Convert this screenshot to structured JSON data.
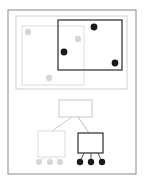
{
  "diagram": {
    "type": "r-tree-spatial-index",
    "colors": {
      "frame": "#8a8a8a",
      "panel": "#cfcfcf",
      "light_group": "#dcdcdc",
      "light_dot": "#d6d6d6",
      "dark_group": "#3a3a3a",
      "dark_dot": "#1a1a1a",
      "edge_light": "#cccccc",
      "edge_dark": "#555555"
    },
    "spatial_view": {
      "light_rect": {
        "x": 22,
        "y": 26,
        "w": 62,
        "h": 59
      },
      "dark_rect": {
        "x": 58,
        "y": 20,
        "w": 64,
        "h": 50
      },
      "light_points": [
        [
          28,
          32
        ],
        [
          78,
          39
        ],
        [
          49,
          78
        ]
      ],
      "dark_points": [
        [
          94,
          27
        ],
        [
          64,
          52
        ],
        [
          115,
          63
        ]
      ]
    },
    "tree_view": {
      "root": {
        "x": 59,
        "y": 100,
        "w": 33,
        "h": 17
      },
      "left_child": {
        "x": 38,
        "y": 131,
        "w": 27,
        "h": 26
      },
      "right_child": {
        "x": 78,
        "y": 133,
        "w": 25,
        "h": 20
      },
      "left_leaves": [
        [
          39,
          162
        ],
        [
          50,
          162
        ],
        [
          60,
          162
        ]
      ],
      "right_leaves": [
        [
          80,
          162
        ],
        [
          91,
          162
        ],
        [
          102,
          162
        ]
      ]
    }
  }
}
